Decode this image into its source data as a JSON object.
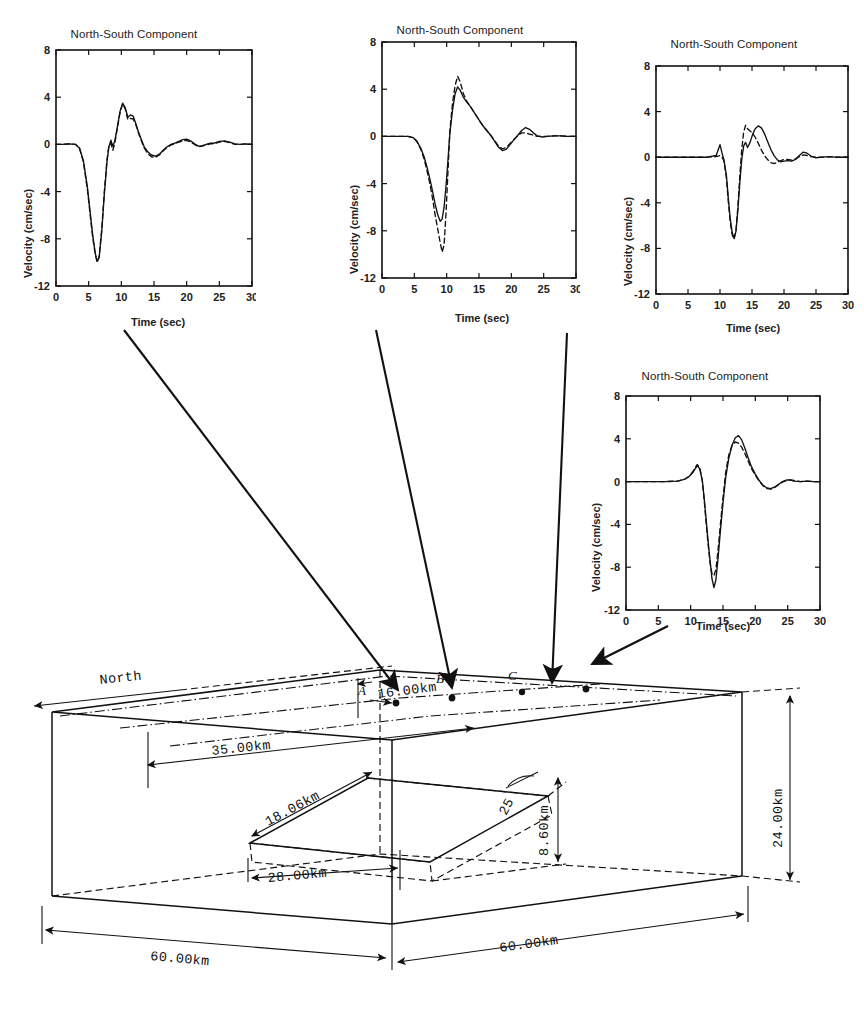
{
  "figure": {
    "axis_titles": {
      "y": "Velocity (cm/sec)",
      "x": "Time (sec)"
    },
    "yticks": [
      "8",
      "4",
      "0",
      "-4",
      "-8",
      "-12"
    ],
    "xticks": [
      "0",
      "5",
      "10",
      "15",
      "20",
      "25",
      "30"
    ]
  },
  "chart_data": [
    {
      "type": "line",
      "station": "A",
      "title": "North-South Component",
      "xlabel": "Time (sec)",
      "ylabel": "Velocity (cm/sec)",
      "xlim": [
        0,
        30
      ],
      "ylim": [
        -12,
        8
      ],
      "xticks": [
        0,
        5,
        10,
        15,
        20,
        25,
        30
      ],
      "yticks": [
        -12,
        -8,
        -4,
        0,
        4,
        8
      ],
      "grid": false,
      "legend": "none",
      "series": [
        {
          "name": "solid",
          "style": "solid",
          "x": [
            0,
            1,
            2,
            3,
            3.6,
            4.2,
            4.8,
            5.2,
            5.6,
            6,
            6.3,
            6.6,
            7,
            7.4,
            7.8,
            8.1,
            8.4,
            8.7,
            9,
            9.4,
            9.8,
            10.2,
            10.6,
            11,
            11.4,
            11.8,
            12.2,
            12.6,
            13,
            13.5,
            14,
            14.6,
            15.2,
            15.8,
            16.4,
            17,
            17.6,
            18.2,
            18.8,
            19.4,
            20,
            20.6,
            21.2,
            21.8,
            22.4,
            23,
            23.6,
            24.2,
            25,
            25.8,
            26.6,
            27.4,
            28.2,
            29,
            30
          ],
          "y": [
            0,
            0,
            0.05,
            0,
            -0.3,
            -1.4,
            -3.6,
            -5.6,
            -7.6,
            -9.2,
            -9.9,
            -9.6,
            -7.4,
            -4.2,
            -1.5,
            -0.2,
            0.35,
            -0.15,
            0.3,
            1.5,
            2.8,
            3.5,
            3.1,
            2.3,
            2.5,
            2.4,
            1.8,
            1.1,
            0.5,
            -0.2,
            -0.6,
            -0.9,
            -1.0,
            -0.85,
            -0.5,
            -0.2,
            0,
            0.1,
            0.25,
            0.4,
            0.45,
            0.3,
            0.05,
            -0.15,
            -0.1,
            0,
            0.1,
            0.1,
            0.25,
            0.3,
            0.2,
            0.05,
            0,
            0.05,
            0
          ]
        },
        {
          "name": "dashed",
          "style": "dashed",
          "x": [
            0,
            1,
            2,
            3,
            3.6,
            4.2,
            4.8,
            5.2,
            5.6,
            6,
            6.3,
            6.6,
            7,
            7.4,
            7.8,
            8.1,
            8.4,
            8.7,
            9,
            9.4,
            9.8,
            10.2,
            10.6,
            11,
            11.4,
            11.8,
            12.2,
            12.6,
            13,
            13.5,
            14,
            14.6,
            15.2,
            15.8,
            16.4,
            17,
            17.6,
            18.2,
            18.8,
            19.4,
            20,
            20.6,
            21.2,
            21.8,
            22.4,
            23,
            23.6,
            24.2,
            25,
            25.8,
            26.6,
            27.4,
            28.2,
            29,
            30
          ],
          "y": [
            0,
            0,
            0.05,
            0,
            -0.35,
            -1.5,
            -3.8,
            -5.8,
            -7.8,
            -9.3,
            -10.0,
            -9.5,
            -7.2,
            -4.0,
            -1.3,
            -0.1,
            0.1,
            -0.5,
            0.1,
            1.4,
            2.7,
            3.45,
            3.0,
            2.1,
            2.2,
            2.15,
            1.7,
            1.0,
            0.4,
            -0.3,
            -0.75,
            -1.05,
            -1.1,
            -0.9,
            -0.55,
            -0.25,
            -0.05,
            0.05,
            0.2,
            0.3,
            0.35,
            0.2,
            0,
            -0.2,
            -0.15,
            -0.05,
            0.05,
            0.05,
            0.2,
            0.25,
            0.15,
            0,
            0,
            0.05,
            0
          ]
        }
      ]
    },
    {
      "type": "line",
      "station": "B",
      "title": "North-South Component",
      "xlabel": "Time (sec)",
      "ylabel": "Velocity (cm/sec)",
      "xlim": [
        0,
        30
      ],
      "ylim": [
        -12,
        8
      ],
      "xticks": [
        0,
        5,
        10,
        15,
        20,
        25,
        30
      ],
      "yticks": [
        -12,
        -8,
        -4,
        0,
        4,
        8
      ],
      "grid": false,
      "legend": "none",
      "series": [
        {
          "name": "solid",
          "style": "solid",
          "x": [
            0,
            1,
            2,
            3,
            4,
            4.8,
            5.4,
            6,
            6.5,
            7,
            7.4,
            7.8,
            8.2,
            8.6,
            9,
            9.3,
            9.6,
            9.9,
            10.2,
            10.5,
            10.9,
            11.3,
            11.7,
            12.1,
            12.6,
            13.1,
            13.7,
            14.3,
            15,
            15.6,
            16.2,
            16.8,
            17.4,
            18,
            18.6,
            19.2,
            19.8,
            20.4,
            21,
            21.6,
            22.2,
            22.8,
            23.4,
            24,
            24.8,
            25.6,
            26.6,
            27.6,
            28.6,
            30
          ],
          "y": [
            0,
            0,
            0,
            0,
            0,
            -0.1,
            -0.4,
            -1.0,
            -1.7,
            -2.7,
            -3.6,
            -4.6,
            -5.7,
            -6.6,
            -7.2,
            -7.0,
            -6.0,
            -4.2,
            -2.0,
            0.3,
            2.2,
            3.6,
            4.2,
            3.9,
            3.3,
            2.9,
            2.5,
            2.0,
            1.4,
            0.9,
            0.5,
            0.1,
            -0.4,
            -0.9,
            -1.2,
            -1.1,
            -0.7,
            -0.3,
            0.1,
            0.5,
            0.75,
            0.6,
            0.3,
            0.05,
            -0.05,
            0,
            0.05,
            0.05,
            0,
            0
          ]
        },
        {
          "name": "dashed",
          "style": "dashed",
          "x": [
            0,
            1,
            2,
            3,
            4,
            4.8,
            5.4,
            6,
            6.5,
            7,
            7.4,
            7.8,
            8.2,
            8.6,
            9,
            9.3,
            9.6,
            9.9,
            10.2,
            10.5,
            10.9,
            11.3,
            11.7,
            12.1,
            12.6,
            13.1,
            13.7,
            14.3,
            15,
            15.6,
            16.2,
            16.8,
            17.4,
            18,
            18.6,
            19.2,
            19.8,
            20.4,
            21,
            21.6,
            22.2,
            22.8,
            23.4,
            24,
            24.8,
            25.6,
            26.6,
            27.6,
            28.6,
            30
          ],
          "y": [
            0,
            0,
            0,
            0,
            0,
            -0.1,
            -0.45,
            -1.1,
            -1.9,
            -3.0,
            -4.0,
            -5.2,
            -6.6,
            -7.8,
            -9.0,
            -9.8,
            -9.2,
            -6.5,
            -3.0,
            0.5,
            2.8,
            4.3,
            5.1,
            4.6,
            3.6,
            3.0,
            2.5,
            2.0,
            1.4,
            0.9,
            0.5,
            0.1,
            -0.35,
            -0.8,
            -1.05,
            -0.95,
            -0.6,
            -0.25,
            0.05,
            0.3,
            0.3,
            0.2,
            0.1,
            0,
            0,
            0,
            0.05,
            0.05,
            0,
            0
          ]
        }
      ]
    },
    {
      "type": "line",
      "station": "C",
      "title": "North-South Component",
      "xlabel": "Time (sec)",
      "ylabel": "Velocity (cm/sec)",
      "xlim": [
        0,
        30
      ],
      "ylim": [
        -12,
        8
      ],
      "xticks": [
        0,
        5,
        10,
        15,
        20,
        25,
        30
      ],
      "yticks": [
        -12,
        -8,
        -4,
        0,
        4,
        8
      ],
      "grid": false,
      "legend": "none",
      "series": [
        {
          "name": "solid",
          "style": "solid",
          "x": [
            0,
            2,
            4,
            6,
            8,
            9.4,
            10,
            10.3,
            10.6,
            11,
            11.3,
            11.6,
            11.9,
            12.2,
            12.5,
            12.8,
            13.1,
            13.4,
            13.7,
            14,
            14.3,
            14.7,
            15.1,
            15.5,
            16,
            16.5,
            17,
            17.5,
            18,
            18.5,
            19,
            19.5,
            20,
            20.6,
            21.2,
            21.8,
            22.4,
            23,
            23.6,
            24.2,
            25,
            26,
            27,
            28,
            29,
            30
          ],
          "y": [
            0,
            0,
            0,
            0,
            0,
            0.15,
            1.1,
            0.4,
            -0.2,
            -1.6,
            -3.6,
            -5.4,
            -6.6,
            -7.1,
            -6.5,
            -4.6,
            -2.2,
            -0.2,
            1.0,
            1.3,
            0.85,
            1.3,
            2.0,
            2.5,
            2.75,
            2.55,
            2.0,
            1.3,
            0.6,
            0.1,
            -0.25,
            -0.4,
            -0.35,
            -0.3,
            -0.35,
            -0.2,
            0.15,
            0.45,
            0.35,
            0.1,
            -0.05,
            0,
            0.05,
            0,
            0,
            0
          ]
        },
        {
          "name": "dashed",
          "style": "dashed",
          "x": [
            0,
            2,
            4,
            6,
            8,
            9.4,
            10,
            10.3,
            10.6,
            11,
            11.3,
            11.6,
            11.9,
            12.2,
            12.5,
            12.8,
            13.1,
            13.4,
            13.7,
            14,
            14.3,
            14.7,
            15.1,
            15.5,
            16,
            16.5,
            17,
            17.5,
            18,
            18.5,
            19,
            19.5,
            20,
            20.6,
            21.2,
            21.8,
            22.4,
            23,
            23.6,
            24.2,
            25,
            26,
            27,
            28,
            29,
            30
          ],
          "y": [
            0,
            0,
            0,
            0,
            0,
            0.05,
            0.15,
            0.05,
            -0.3,
            -1.8,
            -3.9,
            -5.7,
            -6.8,
            -7.2,
            -6.4,
            -4.3,
            -1.6,
            0.7,
            2.2,
            2.8,
            2.5,
            2.3,
            2.1,
            1.75,
            1.2,
            0.6,
            0.1,
            -0.25,
            -0.5,
            -0.55,
            -0.45,
            -0.3,
            -0.2,
            -0.2,
            -0.25,
            -0.15,
            0.05,
            0.2,
            0.15,
            0.05,
            0,
            0,
            0.05,
            0,
            0,
            0
          ]
        }
      ]
    },
    {
      "type": "line",
      "station": "D",
      "title": "North-South Component",
      "xlabel": "Time (sec)",
      "ylabel": "Velocity (cm/sec)",
      "xlim": [
        0,
        30
      ],
      "ylim": [
        -12,
        8
      ],
      "xticks": [
        0,
        5,
        10,
        15,
        20,
        25,
        30
      ],
      "yticks": [
        -12,
        -8,
        -4,
        0,
        4,
        8
      ],
      "grid": false,
      "legend": "none",
      "series": [
        {
          "name": "solid",
          "style": "solid",
          "x": [
            0,
            2,
            4,
            6,
            8,
            9,
            9.8,
            10.4,
            11,
            11.4,
            11.8,
            12.1,
            12.4,
            12.7,
            13,
            13.3,
            13.6,
            13.9,
            14.2,
            14.6,
            15,
            15.4,
            15.9,
            16.4,
            16.9,
            17.4,
            17.9,
            18.4,
            18.9,
            19.4,
            20,
            20.6,
            21.2,
            21.8,
            22.4,
            23,
            23.6,
            24.2,
            24.8,
            25.4,
            26,
            27,
            28,
            29,
            30
          ],
          "y": [
            0,
            0,
            0,
            0,
            0.05,
            0.2,
            0.5,
            0.9,
            1.5,
            1.2,
            0.1,
            -1.6,
            -3.6,
            -5.6,
            -7.4,
            -9.1,
            -9.9,
            -9.2,
            -7.4,
            -4.6,
            -2.0,
            0.3,
            2.2,
            3.4,
            4.1,
            4.3,
            3.9,
            3.1,
            2.2,
            1.4,
            0.7,
            0.1,
            -0.35,
            -0.6,
            -0.65,
            -0.5,
            -0.25,
            0,
            0.15,
            0.15,
            0.05,
            0,
            0.05,
            0,
            0
          ]
        },
        {
          "name": "dashed",
          "style": "dashed",
          "x": [
            0,
            2,
            4,
            6,
            8,
            9,
            9.8,
            10.4,
            11,
            11.4,
            11.8,
            12.1,
            12.4,
            12.7,
            13,
            13.3,
            13.6,
            13.9,
            14.2,
            14.6,
            15,
            15.4,
            15.9,
            16.4,
            16.9,
            17.4,
            17.9,
            18.4,
            18.9,
            19.4,
            20,
            20.6,
            21.2,
            21.8,
            22.4,
            23,
            23.6,
            24.2,
            24.8,
            25.4,
            26,
            27,
            28,
            29,
            30
          ],
          "y": [
            0,
            0,
            0,
            0,
            0.05,
            0.2,
            0.5,
            1.0,
            1.6,
            1.3,
            0.1,
            -1.8,
            -3.9,
            -5.9,
            -7.6,
            -8.6,
            -8.8,
            -8.2,
            -6.6,
            -4.0,
            -1.5,
            0.8,
            2.5,
            3.4,
            3.7,
            3.6,
            3.2,
            2.6,
            1.9,
            1.2,
            0.6,
            0.05,
            -0.4,
            -0.65,
            -0.7,
            -0.55,
            -0.3,
            -0.05,
            0.1,
            0.15,
            0.1,
            0,
            0.05,
            0,
            0
          ]
        }
      ]
    }
  ],
  "block": {
    "north_label": "North",
    "stations": [
      {
        "label": "A"
      },
      {
        "label": "B"
      },
      {
        "label": "C"
      },
      {
        "label": "D"
      }
    ],
    "dimensions": {
      "depth_to_top": "16.00km",
      "along_strike_offset": "35.00km",
      "fault_width": "18.06km",
      "fault_horizontal": "28.00km",
      "fault_depth": "8.60km",
      "model_depth": "24.00km",
      "length_left": "60.00km",
      "length_right": "60.00km",
      "dip_angle": "25"
    }
  }
}
